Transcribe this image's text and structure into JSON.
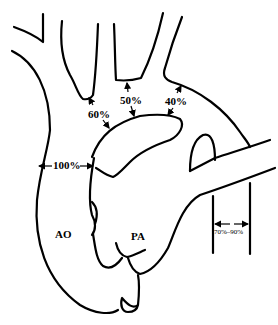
{
  "diagram": {
    "labels": {
      "aorta": "AO",
      "pulmonary_artery": "PA",
      "ascending_aorta_pct": "100%",
      "brachiocephalic_pct": "60%",
      "left_carotid_pct": "50%",
      "left_subclavian_pct": "40%",
      "descending_aorta_pct": "70%–90%"
    },
    "colors": {
      "stroke": "#000000",
      "background": "#ffffff"
    }
  }
}
